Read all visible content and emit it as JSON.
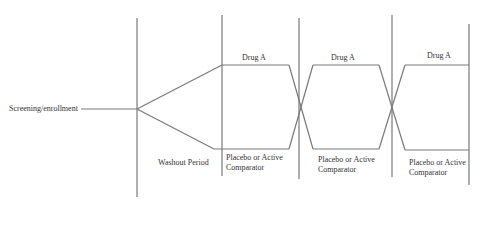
{
  "diagram": {
    "type": "crossover-trial-flow",
    "stroke_color": "#7a7a7a",
    "labels": {
      "screening": "Screening/enrollment",
      "washout": "Washout Period",
      "period1_top": "Drug A",
      "period2_top": "Drug A",
      "period3_top": "Drug A",
      "period1_bottom_line1": "Placebo or Active",
      "period1_bottom_line2": "Comparator",
      "period2_bottom_line1": "Placebo or Active",
      "period2_bottom_line2": "Comparator",
      "period3_bottom_line1": "Placebo or Active",
      "period3_bottom_line2": "Comparator"
    }
  }
}
